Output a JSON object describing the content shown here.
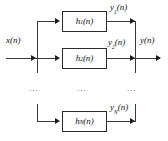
{
  "diagram": {
    "type": "block-diagram",
    "input": {
      "label": "x(n)"
    },
    "output": {
      "label": "y(n)"
    },
    "branches": [
      {
        "block_label": "h",
        "block_sub": "1",
        "block_suffix": "(n)",
        "out_label": "y",
        "out_sub": "1",
        "out_suffix": "(n)"
      },
      {
        "block_label": "h",
        "block_sub": "2",
        "block_suffix": "(n)",
        "out_label": "y",
        "out_sub": "2",
        "out_suffix": "(n)"
      },
      {
        "block_label": "h",
        "block_sub": "N",
        "block_suffix": "(n)",
        "out_label": "y",
        "out_sub": "N",
        "out_suffix": "(n)"
      }
    ],
    "ellipses": [
      {
        "text": "..."
      },
      {
        "text": "..."
      },
      {
        "text": "..."
      }
    ],
    "colors": {
      "stroke": "#2b2b2b",
      "line": "#3a3a3a",
      "text": "#111111",
      "background": "#ffffff"
    }
  }
}
